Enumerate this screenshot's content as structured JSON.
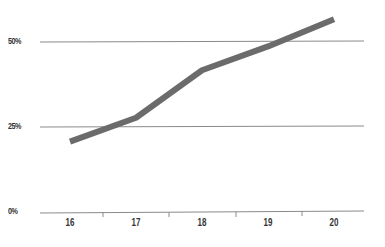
{
  "chart_data": {
    "type": "line",
    "title": "",
    "xlabel": "",
    "ylabel": "",
    "categories": [
      "16",
      "17",
      "18",
      "19",
      "20"
    ],
    "series": [
      {
        "name": "Series 1",
        "values": [
          21,
          28,
          42,
          49,
          57
        ],
        "color": "#6b6b6b"
      }
    ],
    "ylim": [
      0,
      60
    ],
    "y_ticks": [
      "0%",
      "25%",
      "50%"
    ],
    "y_tick_values": [
      0,
      25,
      50
    ],
    "x_ticks": [
      "16",
      "17",
      "18",
      "19",
      "20"
    ],
    "grid": true,
    "legend": "none"
  },
  "axis": {
    "y_labels": [
      "50%",
      "25%",
      "0%"
    ],
    "x_labels": [
      "16",
      "17",
      "18",
      "19",
      "20"
    ]
  },
  "colors": {
    "line": "#6b6b6b",
    "grid": "#8a8a8a",
    "text": "#333333"
  }
}
